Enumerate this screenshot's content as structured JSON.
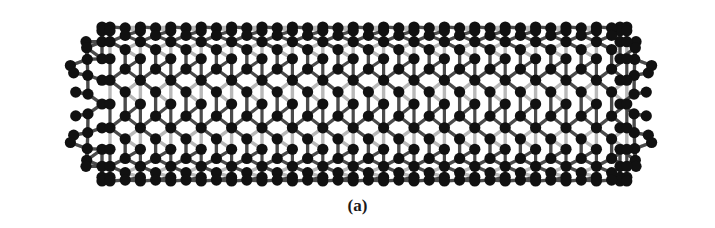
{
  "figure": {
    "caption": "(a)",
    "colors": {
      "front_atom": "#111111",
      "front_bond": "#4a4a4a",
      "back_atom": "#9a9a9a",
      "back_bond": "#b8b8b8",
      "background": "#ffffff"
    },
    "geometry": {
      "left_x": 40,
      "right_x": 683,
      "top_y": 27,
      "bottom_y": 181,
      "hex_columns": 12
    }
  }
}
